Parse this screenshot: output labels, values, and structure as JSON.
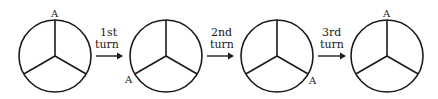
{
  "diagram": {
    "stages": [
      {
        "marker": "A",
        "marker_position": "top"
      },
      {
        "marker": "A",
        "marker_position": "bottom-left"
      },
      {
        "marker": "A",
        "marker_position": "bottom-right"
      },
      {
        "marker": "A",
        "marker_position": "top"
      }
    ],
    "arrows": [
      {
        "line1": "1st",
        "line2": "turn"
      },
      {
        "line1": "2nd",
        "line2": "turn"
      },
      {
        "line1": "3rd",
        "line2": "turn"
      }
    ]
  }
}
